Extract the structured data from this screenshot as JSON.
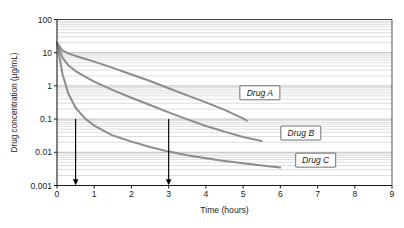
{
  "chart_data": {
    "type": "line",
    "title": "",
    "xlabel": "Time (hours)",
    "ylabel": "Drug concentration (µg/mL)",
    "xlim": [
      0,
      9
    ],
    "ylim": [
      0.001,
      100
    ],
    "yscale": "log",
    "xscale": "linear",
    "grid": "horizontal-minor-log",
    "legend_position": "inline-boxed-labels",
    "xticks": [
      "0",
      "1",
      "2",
      "3",
      "4",
      "5",
      "6",
      "7",
      "8",
      "9"
    ],
    "xtick_values": [
      0,
      1,
      2,
      3,
      4,
      5,
      6,
      7,
      8,
      9
    ],
    "yticks": [
      "100",
      "10",
      "1",
      "0.1",
      "0.01",
      "0.001"
    ],
    "ytick_values": [
      100,
      10,
      1,
      0.1,
      0.01,
      0.001
    ],
    "series": [
      {
        "name": "Drug A",
        "label": "Drug A",
        "color": "#8c8c8c",
        "x": [
          0,
          0.15,
          0.3,
          0.5,
          0.75,
          1.0,
          1.5,
          2.0,
          2.5,
          3.0,
          3.5,
          4.0,
          4.5,
          5.0,
          5.1
        ],
        "y": [
          20,
          11.5,
          9.5,
          8.0,
          6.6,
          5.4,
          3.5,
          2.2,
          1.4,
          0.85,
          0.52,
          0.32,
          0.19,
          0.105,
          0.09
        ]
      },
      {
        "name": "Drug B",
        "label": "Drug B",
        "color": "#8c8c8c",
        "x": [
          0,
          0.15,
          0.3,
          0.5,
          0.75,
          1.0,
          1.5,
          2.0,
          2.5,
          3.0,
          3.5,
          4.0,
          4.5,
          5.0,
          5.5
        ],
        "y": [
          20,
          7.0,
          4.2,
          2.8,
          1.9,
          1.35,
          0.75,
          0.44,
          0.265,
          0.16,
          0.098,
          0.062,
          0.042,
          0.029,
          0.022
        ]
      },
      {
        "name": "Drug C",
        "label": "Drug C",
        "color": "#8c8c8c",
        "x": [
          0,
          0.15,
          0.3,
          0.5,
          0.75,
          1.0,
          1.5,
          2.0,
          2.5,
          3.0,
          3.5,
          4.0,
          4.5,
          5.0,
          5.5,
          6.0
        ],
        "y": [
          20,
          2.2,
          0.6,
          0.22,
          0.105,
          0.064,
          0.032,
          0.021,
          0.0145,
          0.0105,
          0.0082,
          0.0066,
          0.0055,
          0.0047,
          0.004,
          0.0035
        ]
      }
    ],
    "annotations": [
      {
        "name": "arrow-half-hour",
        "type": "arrow-down",
        "x": 0.5,
        "y_from": 0.1,
        "y_to": 0.001,
        "color": "#000000"
      },
      {
        "name": "arrow-three-hour",
        "type": "arrow-down",
        "x": 3.0,
        "y_from": 0.1,
        "y_to": 0.001,
        "color": "#000000"
      }
    ],
    "curve_labels": [
      {
        "name": "Drug A",
        "x": 5.45,
        "y": 0.62
      },
      {
        "name": "Drug B",
        "x": 6.55,
        "y": 0.038
      },
      {
        "name": "Drug C",
        "x": 6.95,
        "y": 0.0058
      }
    ],
    "colors": {
      "curve": "#8c8c8c",
      "gridline": "#c9c9c9",
      "axis": "#1a1a1a",
      "background": "#ffffff",
      "text": "#1a1a1a",
      "label_box_border": "#4d4d4d",
      "arrow": "#000000"
    }
  }
}
